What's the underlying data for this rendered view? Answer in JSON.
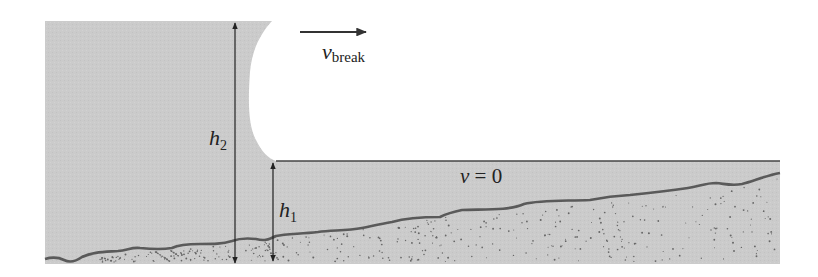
{
  "diagram": {
    "labels": {
      "velocity_symbol": "v",
      "velocity_subscript": "break",
      "h2_symbol": "h",
      "h2_subscript": "2",
      "h1_symbol": "h",
      "h1_subscript": "1",
      "still_water_symbol": "v",
      "still_water_rest": " = 0"
    },
    "colors": {
      "water": "#c9c9c9",
      "seabed_line": "#555555",
      "arrow": "#222222",
      "background": "#ffffff",
      "sediment_dots": "#666666"
    }
  }
}
